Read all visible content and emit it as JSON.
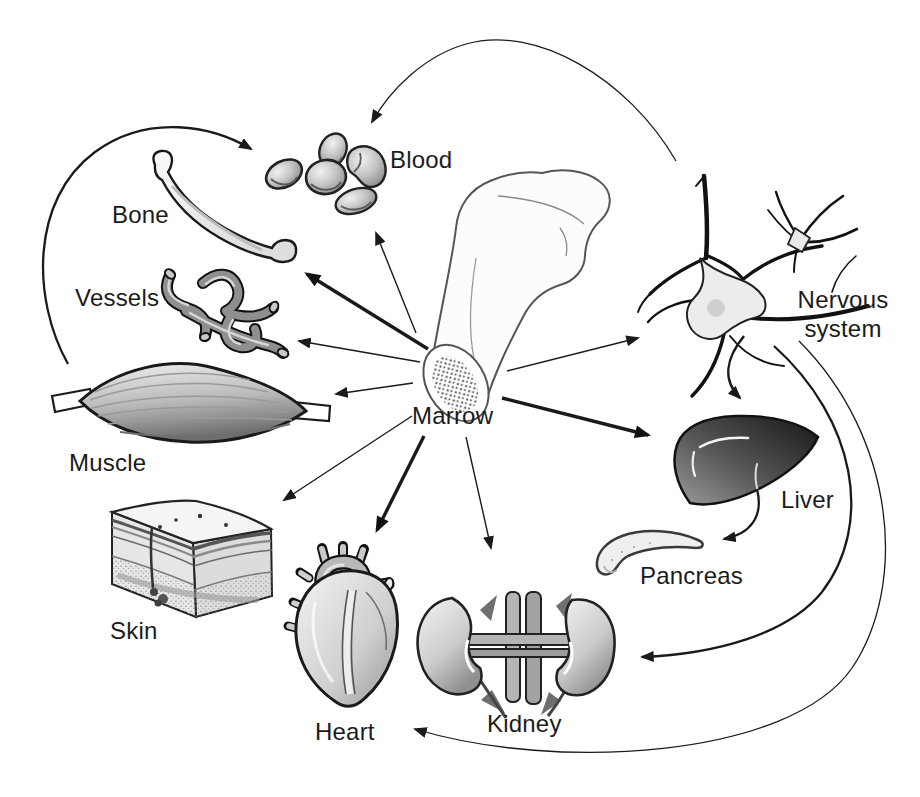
{
  "diagram": {
    "labels": {
      "marrow": "Marrow",
      "blood": "Blood",
      "bone": "Bone",
      "vessels": "Vessels",
      "muscle": "Muscle",
      "skin": "Skin",
      "heart": "Heart",
      "kidney": "Kidney",
      "pancreas": "Pancreas",
      "liver": "Liver",
      "nervous_line1": "Nervous",
      "nervous_line2": "system"
    },
    "connections": [
      {
        "from": "marrow",
        "to": "blood",
        "style": "thin-straight"
      },
      {
        "from": "marrow",
        "to": "bone",
        "style": "bold-straight"
      },
      {
        "from": "marrow",
        "to": "vessels",
        "style": "thin-straight"
      },
      {
        "from": "marrow",
        "to": "muscle",
        "style": "thin-straight"
      },
      {
        "from": "marrow",
        "to": "skin",
        "style": "thin-straight"
      },
      {
        "from": "marrow",
        "to": "heart",
        "style": "bold-straight"
      },
      {
        "from": "marrow",
        "to": "kidney",
        "style": "thin-straight"
      },
      {
        "from": "marrow",
        "to": "liver",
        "style": "bold-straight"
      },
      {
        "from": "marrow",
        "to": "nervous-system",
        "style": "thin-straight"
      },
      {
        "from": "muscle",
        "to": "blood",
        "style": "curved"
      },
      {
        "from": "nervous-system",
        "to": "blood",
        "style": "curved-thin"
      },
      {
        "from": "nervous-system",
        "to": "liver",
        "style": "curved"
      },
      {
        "from": "liver",
        "to": "pancreas",
        "style": "curved"
      },
      {
        "from": "nervous-system",
        "to": "kidney",
        "style": "curved"
      },
      {
        "from": "nervous-system",
        "to": "heart",
        "style": "curved-thin"
      }
    ],
    "colors": {
      "background": "#ffffff",
      "ink": "#1a1a1a",
      "organ_gray": "#9a9a9a",
      "liver_dark": "#1e1e1e"
    }
  }
}
